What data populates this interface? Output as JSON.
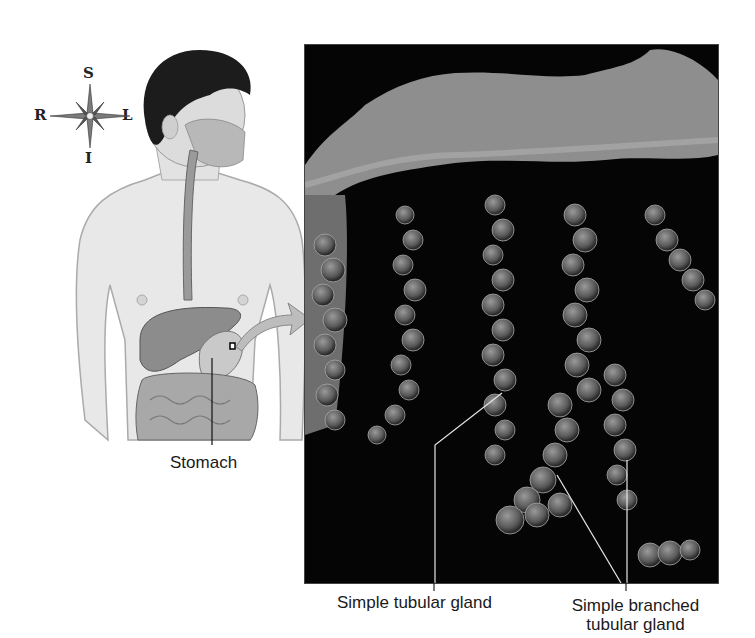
{
  "compass": {
    "north": "S",
    "south": "I",
    "west": "R",
    "east": "L"
  },
  "labels": {
    "stomach": "Stomach",
    "simple_tubular_gland": "Simple tubular gland",
    "simple_branched_line1": "Simple branched",
    "simple_branched_line2": "tubular gland"
  },
  "colors": {
    "background": "#ffffff",
    "micrograph_bg": "#050505",
    "tissue": "#8a8a8a",
    "skin": "#e6e6e6",
    "organ": "#8c8c8c",
    "text": "#1a1a1a"
  }
}
